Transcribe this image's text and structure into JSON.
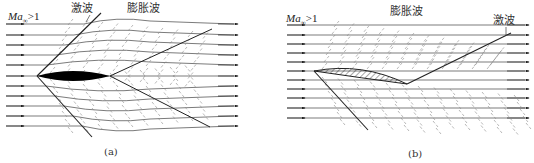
{
  "figure": {
    "panels": [
      {
        "id": "a",
        "caption": "(a)",
        "mach_label": {
          "base": "Ma",
          "sub": "∞",
          "rel": ">1"
        },
        "labels": {
          "shock": "激波",
          "expansion": "膨胀波"
        },
        "airfoil": "biconvex-solid-black",
        "streamline_count": 11
      },
      {
        "id": "b",
        "caption": "(b)",
        "mach_label": {
          "base": "Ma",
          "sub": "∞",
          "rel": ">1"
        },
        "labels": {
          "shock": "激波",
          "expansion": "膨胀波"
        },
        "airfoil": "cambered-plate-hatched",
        "streamline_count": 11
      }
    ],
    "colors": {
      "line": "#222222",
      "wave": "#8a8a8a",
      "text": "#333333",
      "airfoil": "#000000"
    }
  }
}
